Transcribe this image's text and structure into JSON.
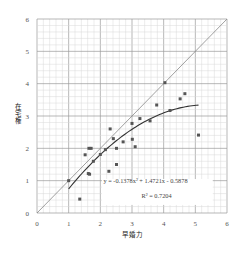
{
  "chart_data": {
    "type": "scatter",
    "title": "",
    "xlabel": "早婚力",
    "ylabel": "在宅権",
    "xlim": [
      0,
      6
    ],
    "ylim": [
      0,
      6
    ],
    "x_ticks": [
      "0",
      "1",
      "2",
      "3",
      "4",
      "5",
      "6"
    ],
    "y_ticks": [
      "0",
      "1",
      "2",
      "3",
      "4",
      "5",
      "6"
    ],
    "grid": true,
    "grid_minor_per_unit": 5,
    "legend": null,
    "series": [
      {
        "name": "data points",
        "kind": "scatter",
        "points": [
          [
            1.0,
            1.0
          ],
          [
            1.35,
            0.43
          ],
          [
            1.52,
            1.8
          ],
          [
            1.62,
            1.22
          ],
          [
            1.66,
            1.2
          ],
          [
            1.64,
            2.0
          ],
          [
            1.71,
            2.0
          ],
          [
            1.78,
            1.6
          ],
          [
            2.0,
            1.81
          ],
          [
            2.16,
            1.96
          ],
          [
            2.27,
            1.29
          ],
          [
            2.31,
            2.6
          ],
          [
            2.41,
            2.3
          ],
          [
            2.51,
            2.0
          ],
          [
            2.51,
            1.5
          ],
          [
            2.72,
            2.2
          ],
          [
            3.0,
            2.77
          ],
          [
            3.01,
            2.28
          ],
          [
            3.1,
            2.05
          ],
          [
            3.25,
            2.92
          ],
          [
            3.57,
            2.85
          ],
          [
            3.78,
            3.34
          ],
          [
            4.04,
            4.03
          ],
          [
            4.2,
            3.17
          ],
          [
            4.52,
            3.53
          ],
          [
            4.67,
            3.69
          ],
          [
            5.1,
            2.41
          ]
        ]
      },
      {
        "name": "y = x reference line",
        "kind": "line",
        "points": [
          [
            0,
            0
          ],
          [
            6,
            6
          ]
        ]
      },
      {
        "name": "quadratic fit",
        "kind": "curve",
        "coefficients": {
          "a": -0.1378,
          "b": 1.4721,
          "c": -0.5878
        },
        "x_range": [
          1.0,
          5.1
        ]
      }
    ],
    "annotations": [
      {
        "text": "y = -0.1378x² + 1.4721x - 0.5878",
        "x": 2.1,
        "y": 0.93
      },
      {
        "text": "R² = 0.7204",
        "x": 3.3,
        "y": 0.45
      }
    ]
  },
  "labels": {
    "equation": "y =  -0.1378x² + 1.4721x  - 0.5878",
    "r_squared": "R² = 0.7204",
    "x_axis_title": "早婚力",
    "y_axis_title_chars": [
      "在",
      "宅",
      "権"
    ]
  },
  "colors": {
    "grid_minor": "#d8d8d8",
    "grid_major": "#9a9a9a",
    "point": "#555555",
    "fit_line": "#333333",
    "ref_line": "#888888"
  }
}
